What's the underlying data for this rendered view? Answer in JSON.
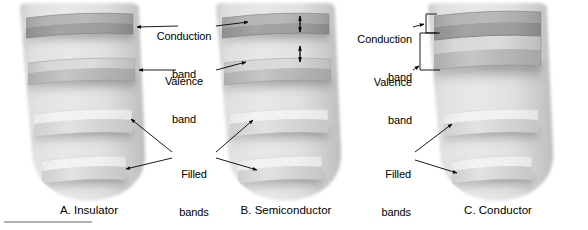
{
  "figure": {
    "panels": [
      {
        "id": "a",
        "caption": "A. Insulator",
        "bands": [
          {
            "name": "conduction band",
            "fill": "empty",
            "shade": "#a9a9a9"
          },
          {
            "name": "valence band",
            "fill": "empty",
            "shade": "#c9c9c9"
          },
          {
            "name": "filled band upper",
            "fill": "filled",
            "shade": "#ececec"
          },
          {
            "name": "filled band lower",
            "fill": "filled",
            "shade": "#ececec"
          }
        ]
      },
      {
        "id": "b",
        "caption": "B. Semiconductor",
        "bands": [
          {
            "name": "conduction band",
            "fill": "empty",
            "shade": "#a9a9a9"
          },
          {
            "name": "valence band",
            "fill": "empty",
            "shade": "#c9c9c9"
          },
          {
            "name": "filled band upper",
            "fill": "filled",
            "shade": "#ececec"
          },
          {
            "name": "filled band lower",
            "fill": "filled",
            "shade": "#ececec"
          }
        ],
        "gap_arrows": 2
      },
      {
        "id": "c",
        "caption": "C. Conductor",
        "bands": [
          {
            "name": "conduction band",
            "fill": "empty",
            "shade": "#a9a9a9"
          },
          {
            "name": "valence band",
            "fill": "empty",
            "shade": "#c9c9c9"
          },
          {
            "name": "filled band upper",
            "fill": "filled",
            "shade": "#ececec"
          },
          {
            "name": "filled band lower",
            "fill": "filled",
            "shade": "#ececec"
          }
        ],
        "bands_overlap": true
      }
    ],
    "labels": {
      "conduction_band_line1": "Conduction",
      "conduction_band_line2": "band",
      "valence_band_line1": "Valence",
      "valence_band_line2": "band",
      "filled_bands_line1": "Filled",
      "filled_bands_line2": "bands",
      "conduction_band_c_line1": "Conduction",
      "conduction_band_c_line2": "band",
      "valence_band_c_line1": "Valence",
      "valence_band_c_line2": "band",
      "filled_bands_c_line1": "Filled",
      "filled_bands_c_line2": "bands"
    },
    "colors": {
      "body_light": "#e2e2e2",
      "body_mid": "#d2d2d2",
      "body_dark": "#b6b6b6",
      "band_empty_top": "#b2b2b2",
      "band_empty_face": "#9a9a9a",
      "band_filled_top": "#f1f1f1",
      "band_filled_face": "#d9d9d9",
      "line": "#000000",
      "background": "#ffffff"
    }
  }
}
